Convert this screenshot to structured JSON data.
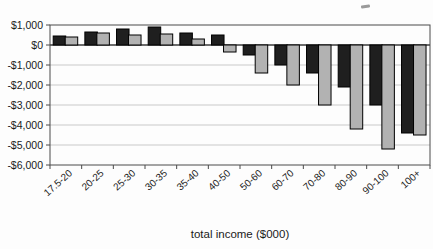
{
  "chart_data": {
    "type": "bar",
    "title": "",
    "xlabel": "total income ($000)",
    "ylabel": "",
    "categories": [
      "17.5-20",
      "20-25",
      "25-30",
      "30-35",
      "35-40",
      "40-50",
      "50-60",
      "60-70",
      "70-80",
      "80-90",
      "90-100",
      "100+"
    ],
    "series": [
      {
        "name": "series-black",
        "color": "#1f1f1f",
        "values": [
          450,
          650,
          800,
          900,
          600,
          500,
          -500,
          -1000,
          -1400,
          -2100,
          -3000,
          -4400
        ]
      },
      {
        "name": "series-gray",
        "color": "#b2b2b2",
        "values": [
          400,
          600,
          500,
          550,
          300,
          -350,
          -1400,
          -2000,
          -3000,
          -4200,
          -5200,
          -4500
        ]
      }
    ],
    "ylim": [
      -6000,
      1000
    ],
    "ytick_step": 1000,
    "y_tick_labels": [
      "$1,000",
      "$0",
      "-$1,000",
      "-$2,000",
      "-$3,000",
      "-$4,000",
      "-$5,000",
      "-$6,000"
    ],
    "grid": "horizontal",
    "legend": "none"
  },
  "style": {
    "plot_border_color": "#4a4a4a",
    "gridline_color": "#c9c9c9",
    "zero_line_color": "#3a3a3a",
    "bar_border_color": "#000000",
    "text_color": "#1a1a1a",
    "background": "#fdfdfd"
  }
}
